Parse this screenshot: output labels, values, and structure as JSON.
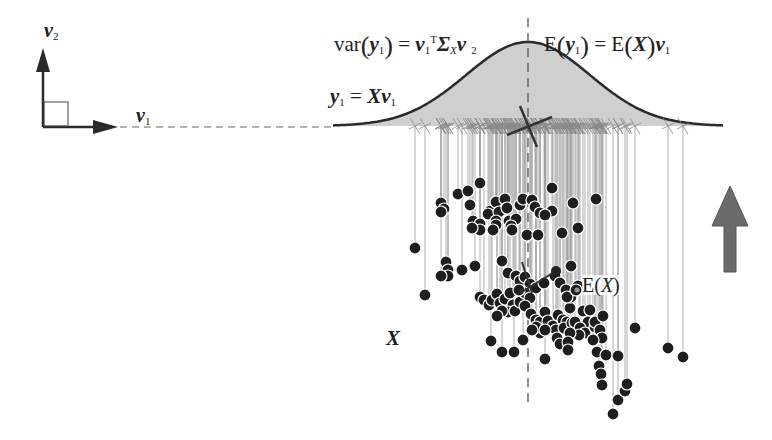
{
  "labels": {
    "v2": "v",
    "v2_sub": "2",
    "v1": "v",
    "v1_sub": "1",
    "var_fn": "var",
    "var_y": "y",
    "var_y_sub": "1",
    "var_eq": "=",
    "var_v": "v",
    "var_v_sub": "1",
    "var_T": "T",
    "var_sigma": "Σ",
    "var_sigma_sub": "X",
    "var_v2": "v",
    "var_v2_sub": "2",
    "mean_E": "E",
    "mean_y": "y",
    "mean_y_sub": "1",
    "mean_eq": "=",
    "mean_E2": "E",
    "mean_X": "X",
    "mean_v": "v",
    "mean_v_sub": "1",
    "proj_y": "y",
    "proj_y_sub": "1",
    "proj_eq": "=",
    "proj_X": "X",
    "proj_v": "v",
    "proj_v_sub": "1",
    "ex_E": "E(",
    "ex_X": "X",
    "ex_close": ")",
    "data_X": "X"
  },
  "colors": {
    "ink": "#2a2a2a",
    "curve_fill": "#cfcfcf",
    "projection_line": "#9a9a9a",
    "big_arrow": "#6a6a6a"
  },
  "diagram": {
    "axis_y": 126,
    "mean_x": 528,
    "points": [
      [
        441,
        203
      ],
      [
        444,
        209
      ],
      [
        441,
        212
      ],
      [
        458,
        194
      ],
      [
        470,
        205
      ],
      [
        468,
        191
      ],
      [
        480,
        183
      ],
      [
        490,
        211
      ],
      [
        496,
        202
      ],
      [
        488,
        214
      ],
      [
        499,
        212
      ],
      [
        505,
        199
      ],
      [
        507,
        208
      ],
      [
        496,
        221
      ],
      [
        509,
        221
      ],
      [
        516,
        219
      ],
      [
        511,
        226
      ],
      [
        512,
        230
      ],
      [
        496,
        225
      ],
      [
        473,
        221
      ],
      [
        480,
        224
      ],
      [
        480,
        230
      ],
      [
        472,
        228
      ],
      [
        493,
        230
      ],
      [
        520,
        205
      ],
      [
        523,
        199
      ],
      [
        532,
        200
      ],
      [
        535,
        207
      ],
      [
        540,
        213
      ],
      [
        552,
        188
      ],
      [
        552,
        211
      ],
      [
        573,
        203
      ],
      [
        596,
        199
      ],
      [
        545,
        215
      ],
      [
        527,
        235
      ],
      [
        538,
        235
      ],
      [
        562,
        233
      ],
      [
        578,
        228
      ],
      [
        415,
        248
      ],
      [
        446,
        262
      ],
      [
        448,
        270
      ],
      [
        448,
        276
      ],
      [
        462,
        270
      ],
      [
        475,
        266
      ],
      [
        502,
        261
      ],
      [
        441,
        276
      ],
      [
        425,
        295
      ],
      [
        508,
        273
      ],
      [
        516,
        276
      ],
      [
        520,
        281
      ],
      [
        525,
        277
      ],
      [
        530,
        284
      ],
      [
        536,
        288
      ],
      [
        544,
        283
      ],
      [
        555,
        276
      ],
      [
        560,
        283
      ],
      [
        571,
        266
      ],
      [
        578,
        286
      ],
      [
        566,
        290
      ],
      [
        480,
        297
      ],
      [
        484,
        300
      ],
      [
        489,
        305
      ],
      [
        492,
        300
      ],
      [
        497,
        294
      ],
      [
        500,
        303
      ],
      [
        505,
        299
      ],
      [
        510,
        293
      ],
      [
        513,
        305
      ],
      [
        508,
        312
      ],
      [
        515,
        311
      ],
      [
        502,
        311
      ],
      [
        497,
        316
      ],
      [
        520,
        302
      ],
      [
        525,
        293
      ],
      [
        530,
        298
      ],
      [
        519,
        290
      ],
      [
        525,
        306
      ],
      [
        531,
        314
      ],
      [
        536,
        320
      ],
      [
        540,
        322
      ],
      [
        545,
        312
      ],
      [
        546,
        328
      ],
      [
        540,
        333
      ],
      [
        536,
        327
      ],
      [
        548,
        321
      ],
      [
        553,
        326
      ],
      [
        556,
        330
      ],
      [
        558,
        315
      ],
      [
        563,
        320
      ],
      [
        567,
        322
      ],
      [
        570,
        308
      ],
      [
        571,
        297
      ],
      [
        567,
        297
      ],
      [
        576,
        290
      ],
      [
        532,
        330
      ],
      [
        545,
        330
      ],
      [
        557,
        338
      ],
      [
        560,
        344
      ],
      [
        564,
        328
      ],
      [
        572,
        323
      ],
      [
        583,
        311
      ],
      [
        590,
        310
      ],
      [
        588,
        322
      ],
      [
        575,
        322
      ],
      [
        580,
        328
      ],
      [
        585,
        333
      ],
      [
        595,
        327
      ],
      [
        595,
        322
      ],
      [
        603,
        316
      ],
      [
        600,
        330
      ],
      [
        602,
        338
      ],
      [
        593,
        340
      ],
      [
        579,
        335
      ],
      [
        570,
        333
      ],
      [
        568,
        342
      ],
      [
        491,
        341
      ],
      [
        502,
        352
      ],
      [
        514,
        352
      ],
      [
        523,
        340
      ],
      [
        545,
        359
      ],
      [
        568,
        350
      ],
      [
        597,
        352
      ],
      [
        606,
        355
      ],
      [
        618,
        356
      ],
      [
        635,
        328
      ],
      [
        668,
        348
      ],
      [
        683,
        357
      ],
      [
        599,
        366
      ],
      [
        601,
        374
      ],
      [
        602,
        385
      ],
      [
        618,
        400
      ],
      [
        625,
        391
      ],
      [
        627,
        384
      ],
      [
        613,
        414
      ]
    ]
  }
}
